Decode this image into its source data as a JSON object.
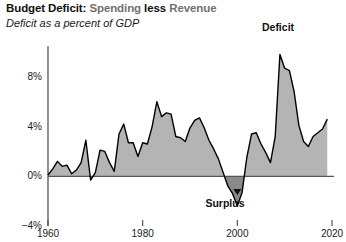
{
  "title": {
    "segment_1": "Budget Deficit:",
    "segment_2": "Spending",
    "segment_3": "less",
    "segment_4": "Revenue",
    "subtitle": "Deficit as a percent of GDP"
  },
  "colors": {
    "deficit_fill": "#b4b4b4",
    "surplus_fill": "#8a8a8a",
    "line": "#000000",
    "axis": "#555555",
    "title_dark": "#111111",
    "title_gray": "#6f6f6f",
    "background": "#ffffff"
  },
  "annotations": [
    {
      "name": "deficit-label",
      "text": "Deficit",
      "x": 278,
      "y": 22
    },
    {
      "name": "surplus-label",
      "text": "Surplus",
      "x": 225,
      "y": 198
    }
  ],
  "chart_data": {
    "type": "area",
    "title": "Budget Deficit: Spending less Revenue",
    "subtitle": "Deficit as a percent of GDP",
    "xlabel": "",
    "ylabel": "Deficit as a percent of GDP",
    "xlim": [
      1960,
      2020
    ],
    "ylim": [
      -4,
      10
    ],
    "grid": false,
    "legend": "none",
    "y_ticks": [
      {
        "value": 8,
        "label": "8%"
      },
      {
        "value": 4,
        "label": "4%"
      },
      {
        "value": 0,
        "label": "0%"
      },
      {
        "value": -4,
        "label": "−4%"
      }
    ],
    "x_ticks": [
      {
        "value": 1960,
        "label": "1960"
      },
      {
        "value": 1980,
        "label": "1980"
      },
      {
        "value": 2000,
        "label": "2000"
      },
      {
        "value": 2020,
        "label": "2020"
      }
    ],
    "series": [
      {
        "name": "Budget deficit (% of GDP)",
        "x": [
          1960,
          1961,
          1962,
          1963,
          1964,
          1965,
          1966,
          1967,
          1968,
          1969,
          1970,
          1971,
          1972,
          1973,
          1974,
          1975,
          1976,
          1977,
          1978,
          1979,
          1980,
          1981,
          1982,
          1983,
          1984,
          1985,
          1986,
          1987,
          1988,
          1989,
          1990,
          1991,
          1992,
          1993,
          1994,
          1995,
          1996,
          1997,
          1998,
          1999,
          2000,
          2001,
          2002,
          2003,
          2004,
          2005,
          2006,
          2007,
          2008,
          2009,
          2010,
          2011,
          2012,
          2013,
          2014,
          2015,
          2016,
          2017,
          2018,
          2019
        ],
        "values": [
          0.1,
          0.6,
          1.2,
          0.8,
          0.9,
          0.2,
          0.5,
          1.1,
          2.9,
          -0.3,
          0.3,
          2.1,
          2.0,
          1.1,
          0.4,
          3.4,
          4.2,
          2.7,
          2.7,
          1.6,
          2.7,
          2.6,
          4.0,
          6.0,
          4.8,
          5.1,
          5.0,
          3.2,
          3.1,
          2.8,
          3.9,
          4.5,
          4.7,
          3.9,
          2.9,
          2.2,
          1.4,
          0.3,
          -0.8,
          -1.4,
          -2.4,
          -1.3,
          1.5,
          3.4,
          3.5,
          2.6,
          1.9,
          1.1,
          3.2,
          9.8,
          8.7,
          8.5,
          6.8,
          4.1,
          2.8,
          2.4,
          3.2,
          3.5,
          3.8,
          4.6
        ]
      }
    ],
    "notes": {
      "deficit_peak": {
        "year": 2009,
        "value": 9.8
      },
      "surplus_period": {
        "start_year": 1998,
        "end_year": 2001,
        "min_value": -2.4
      }
    }
  }
}
